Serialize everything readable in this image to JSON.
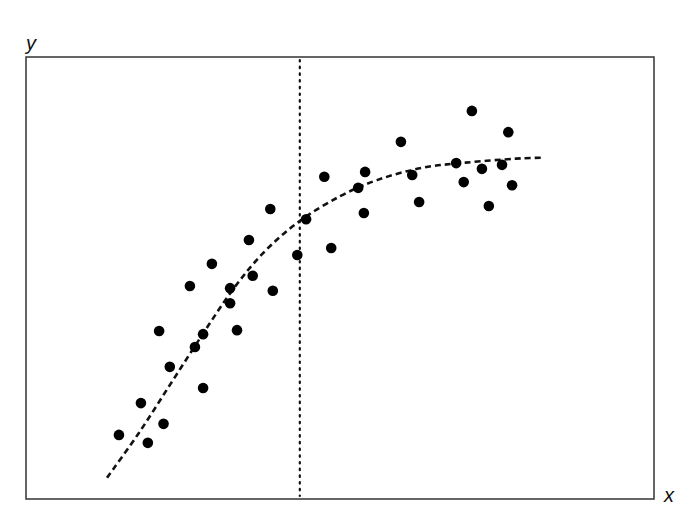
{
  "chart_data": {
    "type": "scatter",
    "title": "",
    "xlabel": "x",
    "ylabel": "y",
    "grid": false,
    "legend": null,
    "axis_ticks": "none",
    "frame_px": {
      "left": 26,
      "top": 57,
      "right": 654,
      "bottom": 499
    },
    "xlim": [
      0,
      100
    ],
    "ylim": [
      0,
      100
    ],
    "points": [
      {
        "x": 14.8,
        "y": 14.5
      },
      {
        "x": 18.3,
        "y": 21.7
      },
      {
        "x": 19.4,
        "y": 12.7
      },
      {
        "x": 21.9,
        "y": 17.0
      },
      {
        "x": 21.2,
        "y": 38.0
      },
      {
        "x": 22.9,
        "y": 29.9
      },
      {
        "x": 26.1,
        "y": 48.2
      },
      {
        "x": 26.9,
        "y": 34.4
      },
      {
        "x": 28.2,
        "y": 37.3
      },
      {
        "x": 28.2,
        "y": 25.1
      },
      {
        "x": 29.6,
        "y": 53.2
      },
      {
        "x": 32.5,
        "y": 47.7
      },
      {
        "x": 32.5,
        "y": 44.3
      },
      {
        "x": 33.6,
        "y": 38.2
      },
      {
        "x": 35.5,
        "y": 58.6
      },
      {
        "x": 36.1,
        "y": 50.5
      },
      {
        "x": 38.9,
        "y": 65.6
      },
      {
        "x": 39.3,
        "y": 47.1
      },
      {
        "x": 43.2,
        "y": 55.2
      },
      {
        "x": 44.6,
        "y": 63.3
      },
      {
        "x": 47.5,
        "y": 72.9
      },
      {
        "x": 48.6,
        "y": 56.8
      },
      {
        "x": 52.9,
        "y": 70.4
      },
      {
        "x": 53.8,
        "y": 64.7
      },
      {
        "x": 54.0,
        "y": 74.0
      },
      {
        "x": 59.7,
        "y": 80.8
      },
      {
        "x": 61.5,
        "y": 73.3
      },
      {
        "x": 62.6,
        "y": 67.2
      },
      {
        "x": 68.5,
        "y": 76.0
      },
      {
        "x": 69.7,
        "y": 71.7
      },
      {
        "x": 71.0,
        "y": 87.8
      },
      {
        "x": 72.6,
        "y": 74.7
      },
      {
        "x": 73.7,
        "y": 66.3
      },
      {
        "x": 75.8,
        "y": 75.6
      },
      {
        "x": 76.8,
        "y": 83.0
      },
      {
        "x": 77.4,
        "y": 71.0
      }
    ],
    "fit_curve": {
      "style": "dashed",
      "description": "concave saturating trend",
      "points": [
        {
          "x": 12.9,
          "y": 4.8
        },
        {
          "x": 18.0,
          "y": 15.0
        },
        {
          "x": 23.0,
          "y": 26.0
        },
        {
          "x": 28.0,
          "y": 37.0
        },
        {
          "x": 33.0,
          "y": 47.5
        },
        {
          "x": 38.0,
          "y": 56.0
        },
        {
          "x": 43.6,
          "y": 62.9
        },
        {
          "x": 50.0,
          "y": 68.5
        },
        {
          "x": 56.0,
          "y": 72.2
        },
        {
          "x": 63.0,
          "y": 74.9
        },
        {
          "x": 70.0,
          "y": 76.1
        },
        {
          "x": 78.0,
          "y": 77.0
        },
        {
          "x": 82.2,
          "y": 77.2
        }
      ]
    },
    "reference_line": {
      "orientation": "vertical",
      "style": "dotted",
      "x": 43.6
    }
  },
  "labels": {
    "x_axis": "x",
    "y_axis": "y"
  },
  "colors": {
    "points": "#000000",
    "frame": "#333333",
    "curve": "#111111"
  }
}
